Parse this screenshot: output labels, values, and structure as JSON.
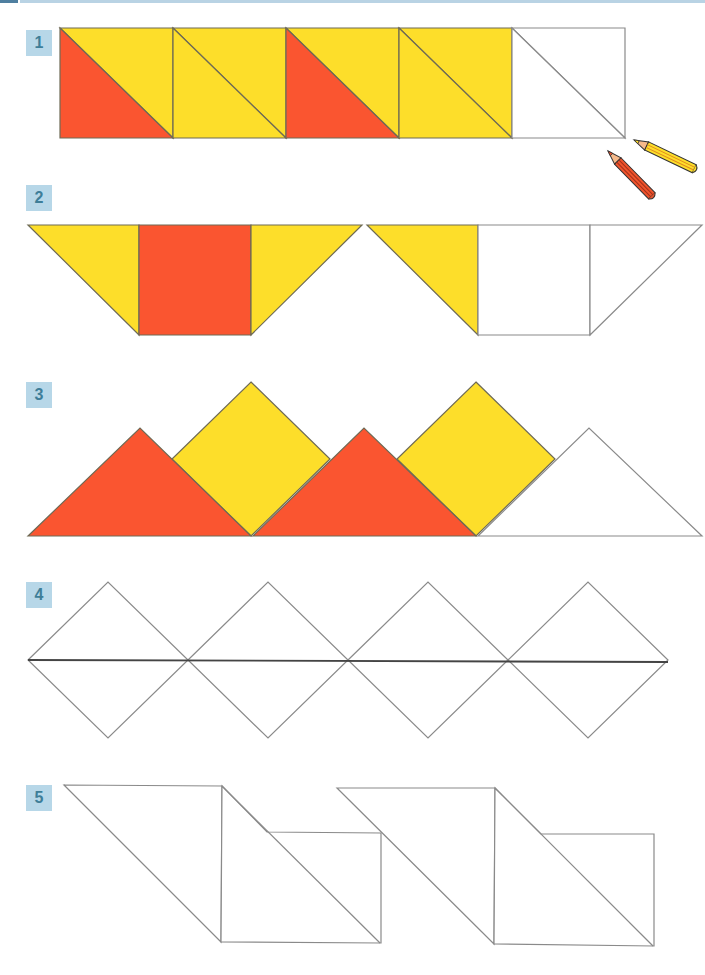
{
  "colors": {
    "red": "#FA5530",
    "yellow": "#FDDE2A",
    "white": "#FFFFFF",
    "stroke": "#6e6a55",
    "outline": "#8a8a8a",
    "label_bg": "#B7D7E8",
    "label_text": "#3E7E98",
    "topbar_dark": "#4F7FA0",
    "topbar_light": "#B9D3E4"
  },
  "exercises": [
    {
      "number": "1",
      "label_pos": [
        26,
        30
      ],
      "description": "Row of 5 squares split by diagonal; pattern red/yellow, yellow/yellow, red/yellow, yellow/yellow, blank",
      "shapes": [
        {
          "type": "polygon",
          "points": "60,28 173,28 173,138",
          "fill": "yellow"
        },
        {
          "type": "polygon",
          "points": "60,28 173,138 60,138",
          "fill": "red"
        },
        {
          "type": "polygon",
          "points": "173,28 286,28 286,138",
          "fill": "yellow"
        },
        {
          "type": "polygon",
          "points": "173,28 286,138 173,138",
          "fill": "yellow"
        },
        {
          "type": "polygon",
          "points": "286,28 399,28 399,138",
          "fill": "yellow"
        },
        {
          "type": "polygon",
          "points": "286,28 399,138 286,138",
          "fill": "red"
        },
        {
          "type": "polygon",
          "points": "399,28 512,28 512,138",
          "fill": "yellow"
        },
        {
          "type": "polygon",
          "points": "399,28 512,138 399,138",
          "fill": "yellow"
        },
        {
          "type": "polygon",
          "points": "512,28 625,28 625,138",
          "fill": "white"
        },
        {
          "type": "polygon",
          "points": "512,28 625,138 512,138",
          "fill": "white"
        }
      ]
    },
    {
      "number": "2",
      "label_pos": [
        26,
        185
      ],
      "description": "Trapezoid bands: yellow triangle, red square, yellow triangle, then yellow triangle, blank square, blank triangle",
      "shapes": [
        {
          "type": "polygon",
          "points": "28,225 139,225 139,335",
          "fill": "yellow"
        },
        {
          "type": "polygon",
          "points": "139,225 251,225 251,335 139,335",
          "fill": "red"
        },
        {
          "type": "polygon",
          "points": "251,225 362,225 251,335",
          "fill": "yellow"
        },
        {
          "type": "polygon",
          "points": "367,225 478,225 478,335",
          "fill": "yellow"
        },
        {
          "type": "polygon",
          "points": "478,225 590,225 590,335 478,335",
          "fill": "white"
        },
        {
          "type": "polygon",
          "points": "590,225 702,225 590,335",
          "fill": "white"
        }
      ]
    },
    {
      "number": "3",
      "label_pos": [
        26,
        382
      ],
      "description": "Mountains: red triangle, yellow diamond, red triangle, yellow diamond, blank triangle",
      "shapes": [
        {
          "type": "polygon",
          "points": "251,382 330,459 251,536 172,459",
          "fill": "yellow"
        },
        {
          "type": "polygon",
          "points": "476,382 555,459 476,536 397,459",
          "fill": "yellow"
        },
        {
          "type": "polygon",
          "points": "28,536 140,428 251,536",
          "fill": "red"
        },
        {
          "type": "polygon",
          "points": "253,536 364,428 476,536",
          "fill": "red"
        },
        {
          "type": "polygon",
          "points": "478,536 589,428 702,536",
          "fill": "white"
        }
      ]
    },
    {
      "number": "4",
      "label_pos": [
        26,
        582
      ],
      "description": "Four blank diamonds joined by a horizontal line",
      "shapes": [
        {
          "type": "polygon",
          "points": "28,660 108,582 188,660 108,738",
          "fill": "white"
        },
        {
          "type": "polygon",
          "points": "188,660 268,582 348,660 268,738",
          "fill": "white"
        },
        {
          "type": "polygon",
          "points": "348,660 428,582 508,660 428,738",
          "fill": "white"
        },
        {
          "type": "polygon",
          "points": "508,660 588,582 668,660 588,738",
          "fill": "white"
        },
        {
          "type": "line",
          "points": "28,660 668,662",
          "fill": "none",
          "heavy": true
        }
      ]
    },
    {
      "number": "5",
      "label_pos": [
        26,
        785
      ],
      "description": "Two blank parallelogram-square-triangle figures",
      "shapes": [
        {
          "type": "polygon",
          "points": "64,785 222,786 221,942",
          "fill": "white"
        },
        {
          "type": "polygon",
          "points": "222,786 267,832 381,833 381,943 221,942",
          "fill": "white"
        },
        {
          "type": "line",
          "points": "222,786 380,943",
          "fill": "none"
        },
        {
          "type": "polygon",
          "points": "337,788 495,788 494,944",
          "fill": "white"
        },
        {
          "type": "polygon",
          "points": "495,788 541,834 654,834 654,946 494,944",
          "fill": "white"
        },
        {
          "type": "line",
          "points": "495,788 653,946",
          "fill": "none"
        }
      ]
    }
  ],
  "decorations": {
    "pencils": [
      {
        "name": "yellow-pencil",
        "tip": [
          634,
          140
        ],
        "end": [
          697,
          170
        ],
        "body": "#FDDE2A",
        "edge": "#E08A1E"
      },
      {
        "name": "red-pencil",
        "tip": [
          608,
          151
        ],
        "end": [
          654,
          198
        ],
        "body": "#F0542C",
        "edge": "#A3301A"
      }
    ]
  }
}
